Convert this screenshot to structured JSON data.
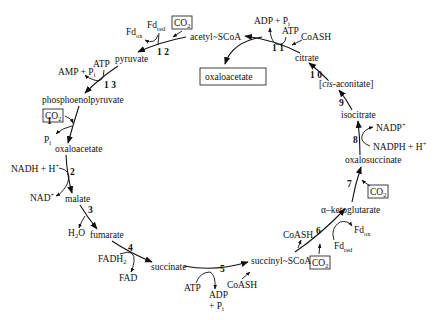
{
  "metabolites": {
    "acetyl_scoa": "acetyl~SCoA",
    "pyruvate": "pyruvate",
    "pep": "phosphoenolpyruvate",
    "oxaloacetate": "oxaloacetate",
    "malate": "malate",
    "fumarate": "fumarate",
    "succinate": "succinate",
    "succinyl_scoa": "succinyl~SCoA",
    "akg": "α–ketoglutarate",
    "oxalosuccinate": "oxalosuccinate",
    "isocitrate": "isocitrate",
    "cis_aconitate_pre": "[",
    "cis_aconitate_italic": "cis",
    "cis_aconitate_post": "-aconitate]",
    "citrate": "citrate",
    "oxaloacetate_product": "oxaloacetate"
  },
  "steps": {
    "s1": "1",
    "s2": "2",
    "s3": "3",
    "s4": "4",
    "s5": "5",
    "s6": "6",
    "s7": "7",
    "s8": "8",
    "s9": "9",
    "s10": "1 0",
    "s11": "1 1",
    "s12": "1 2",
    "s13": "1 3"
  },
  "cofactors": {
    "co2": "CO",
    "co2_sub": "2",
    "pi": "P",
    "pi_sub": "i",
    "nadh": "NADH + H",
    "nadh_sup": "+",
    "nad": "NAD",
    "nad_sup": "+",
    "h2o_h": "H",
    "h2o_sub": "2",
    "h2o_o": "O",
    "fadh2": "FADH",
    "fadh2_sub": "2",
    "fad": "FAD",
    "atp": "ATP",
    "adp": "ADP",
    "plus_pi": "+ P",
    "coash": "CoASH",
    "fd": "Fd",
    "fd_ox_sub": "ox",
    "fd_red_sub": "red",
    "nadp": "NADP",
    "nadp_sup": "+",
    "nadph": "NADPH + H",
    "nadph_sup": "+",
    "adp_pi": "ADP + P",
    "amp_pi": "AMP + P"
  }
}
